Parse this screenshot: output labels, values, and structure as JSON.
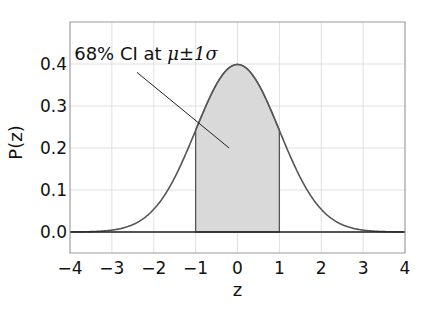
{
  "chart_data": {
    "type": "area",
    "title": "",
    "xlabel": "z",
    "ylabel": "P(z)",
    "xlim": [
      -4,
      4
    ],
    "ylim": [
      -0.05,
      0.5
    ],
    "grid": true,
    "x_ticks": [
      -4,
      -3,
      -2,
      -1,
      0,
      1,
      2,
      3,
      4
    ],
    "x_tick_labels": [
      "−4",
      "−3",
      "−2",
      "−1",
      "0",
      "1",
      "2",
      "3",
      "4"
    ],
    "y_ticks": [
      0.0,
      0.1,
      0.2,
      0.3,
      0.4
    ],
    "y_tick_labels": [
      "0.0",
      "0.1",
      "0.2",
      "0.3",
      "0.4"
    ],
    "series": [
      {
        "name": "Standard normal PDF",
        "function": "normal_pdf",
        "mu": 0,
        "sigma": 1,
        "x_range": [
          -4,
          4
        ],
        "color": "#555555"
      }
    ],
    "shaded_region": {
      "label": "68% CI",
      "x_from": -1,
      "x_to": 1,
      "fill_color": "#d9d9d9",
      "edge_color": "#555555"
    },
    "baseline": {
      "y": 0.0,
      "color": "#222222"
    },
    "annotation": {
      "text_prefix": "68% CI at ",
      "text_math": "μ±1σ",
      "text_xy": [
        -3.9,
        0.41
      ],
      "arrow_from": [
        -2.4,
        0.38
      ],
      "arrow_to": [
        -0.2,
        0.2
      ]
    }
  }
}
